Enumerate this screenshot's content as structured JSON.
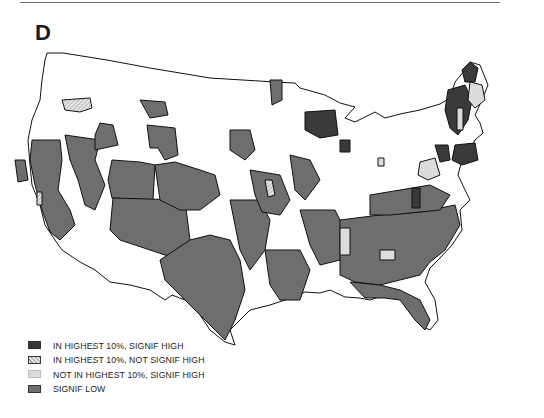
{
  "figure": {
    "panel_label": "D",
    "title": "",
    "region": "Contiguous United States"
  },
  "colors": {
    "in_highest_signif_high": "#3a3a3a",
    "in_highest_not_signif_high": "#d9d9d9",
    "not_in_highest_signif_high": "#dcdcdc",
    "signif_low": "#6e6e6e",
    "background": "#ffffff",
    "border": "#111111"
  },
  "legend": {
    "items": [
      {
        "label": "IN HIGHEST 10%, SIGNIF HIGH",
        "pattern": "solid-dark"
      },
      {
        "label": "IN HIGHEST 10%, NOT SIGNIF HIGH",
        "pattern": "hatched-light"
      },
      {
        "label": "NOT IN HIGHEST 10%, SIGNIF HIGH",
        "pattern": "solid-light"
      },
      {
        "label": "SIGNIF LOW",
        "pattern": "solid-medium"
      }
    ]
  }
}
